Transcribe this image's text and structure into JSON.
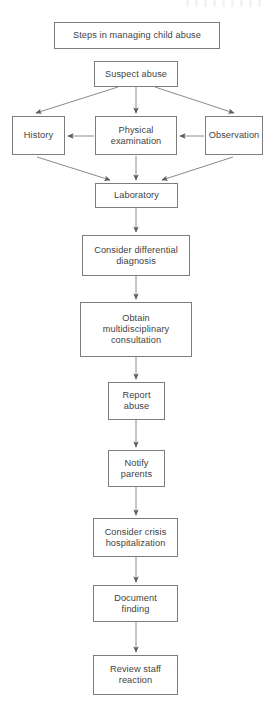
{
  "diagram": {
    "title": "Steps in managing child abuse",
    "type": "flowchart",
    "orientation": "top-to-bottom",
    "line_color": "#7d7d7d",
    "text_color": "#3f3f3f",
    "background": "#ffffff",
    "nodes": [
      {
        "id": "title",
        "label": "Steps in managing child abuse"
      },
      {
        "id": "suspect",
        "label": "Suspect abuse"
      },
      {
        "id": "history",
        "label": "History"
      },
      {
        "id": "physical",
        "label": "Physical\nexamination"
      },
      {
        "id": "observation",
        "label": "Observation"
      },
      {
        "id": "laboratory",
        "label": "Laboratory"
      },
      {
        "id": "differential",
        "label": "Consider differential\ndiagnosis"
      },
      {
        "id": "multidisciplinary",
        "label": "Obtain\nmultidisciplinary\nconsultation"
      },
      {
        "id": "report",
        "label": "Report\nabuse"
      },
      {
        "id": "notify",
        "label": "Notify\nparents"
      },
      {
        "id": "crisis",
        "label": "Consider crisis\nhospitalization"
      },
      {
        "id": "document",
        "label": "Document\nfinding"
      },
      {
        "id": "review",
        "label": "Review staff\nreaction"
      }
    ],
    "edges": [
      {
        "from": "suspect",
        "to": "history",
        "style": "diagonal-arrow"
      },
      {
        "from": "suspect",
        "to": "physical",
        "style": "vertical-arrow"
      },
      {
        "from": "suspect",
        "to": "observation",
        "style": "diagonal-arrow"
      },
      {
        "from": "observation",
        "to": "physical",
        "style": "horizontal-arrow-left"
      },
      {
        "from": "physical",
        "to": "history",
        "style": "horizontal-arrow-left"
      },
      {
        "from": "history",
        "to": "laboratory",
        "style": "diagonal-arrow"
      },
      {
        "from": "physical",
        "to": "laboratory",
        "style": "vertical-arrow"
      },
      {
        "from": "observation",
        "to": "laboratory",
        "style": "diagonal-arrow"
      },
      {
        "from": "laboratory",
        "to": "differential",
        "style": "vertical-arrow"
      },
      {
        "from": "differential",
        "to": "multidisciplinary",
        "style": "vertical-arrow"
      },
      {
        "from": "multidisciplinary",
        "to": "report",
        "style": "vertical-arrow"
      },
      {
        "from": "report",
        "to": "notify",
        "style": "vertical-arrow"
      },
      {
        "from": "notify",
        "to": "crisis",
        "style": "vertical-arrow"
      },
      {
        "from": "crisis",
        "to": "document",
        "style": "vertical-arrow"
      },
      {
        "from": "document",
        "to": "review",
        "style": "vertical-arrow"
      }
    ]
  }
}
